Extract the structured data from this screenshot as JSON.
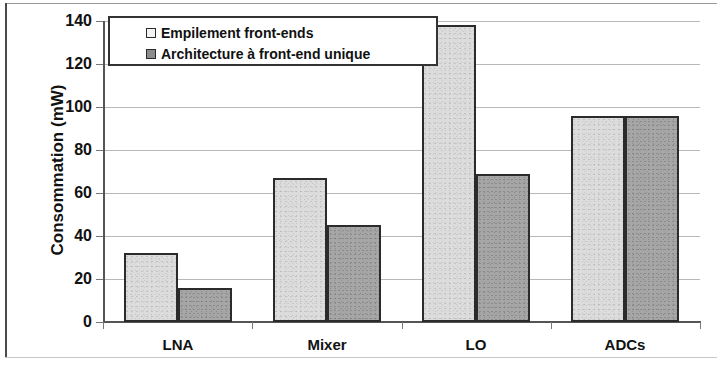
{
  "chart_data": {
    "type": "bar",
    "title": "",
    "xlabel": "",
    "ylabel": "Consommation (mW)",
    "categories": [
      "LNA",
      "Mixer",
      "LO",
      "ADCs"
    ],
    "yticks": [
      0,
      20,
      40,
      60,
      80,
      100,
      120,
      140
    ],
    "ytick_labels": [
      "0",
      "20",
      "40",
      "60",
      "80",
      "100",
      "120",
      "140"
    ],
    "ylim": [
      0,
      140
    ],
    "grid": true,
    "legend_position": "top-left",
    "series": [
      {
        "name": "Empilement front-ends",
        "color": "#dcdcdc",
        "values": [
          32,
          67,
          138,
          96
        ]
      },
      {
        "name": "Architecture à front-end unique",
        "color": "#a6a6a6",
        "values": [
          16,
          45,
          69,
          96
        ]
      }
    ]
  },
  "legend": {
    "entries": [
      {
        "label": "Empilement front-ends"
      },
      {
        "label": "Architecture à front-end unique"
      }
    ]
  },
  "axis": {
    "y_title": "Consommation (mW)"
  }
}
